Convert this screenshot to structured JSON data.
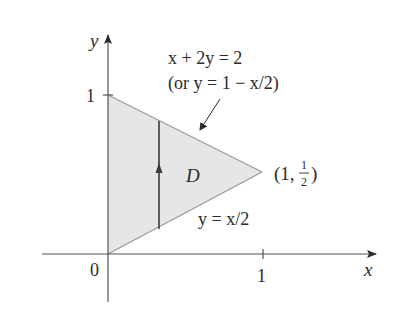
{
  "diagram": {
    "region_label": "D",
    "axes": {
      "x_label": "x",
      "y_label": "y",
      "origin_label": "0",
      "x_tick_label": "1",
      "y_tick_label": "1"
    },
    "upper_boundary": {
      "equation": "x + 2y = 2",
      "alt_equation": "(or y = 1 − x/2)"
    },
    "lower_boundary": {
      "equation": "y = x/2"
    },
    "vertex": {
      "label_prefix": "(1,",
      "frac_num": "1",
      "frac_den": "2",
      "label_suffix": ")"
    },
    "colors": {
      "region_fill": "#e6e6e6",
      "stroke": "#3a3a3a",
      "boundary": "#9a9a9a"
    }
  }
}
